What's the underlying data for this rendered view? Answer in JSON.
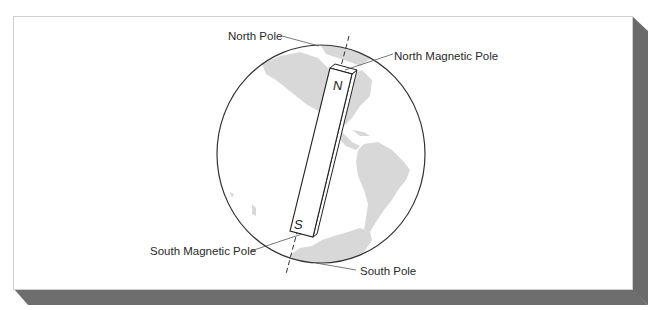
{
  "figure": {
    "type": "diagram",
    "colors": {
      "panel": "#ffffff",
      "panel_border": "#c8c8c8",
      "shadow": "#6e6e6e",
      "globe_outline": "#333333",
      "land": "#d6d6d6",
      "lines": "#444444"
    }
  },
  "labels": {
    "north_pole": "North Pole",
    "north_magnetic_pole": "North Magnetic Pole",
    "south_magnetic_pole": "South Magnetic Pole",
    "south_pole": "South Pole"
  },
  "magnet": {
    "north_letter": "N",
    "south_letter": "S"
  }
}
